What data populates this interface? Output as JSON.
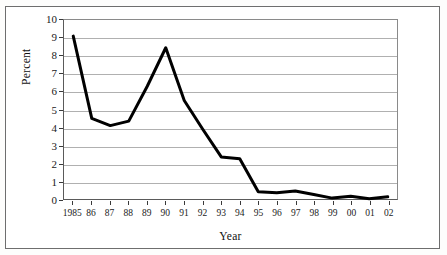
{
  "figure": {
    "background_color": "#ffffff",
    "frame_color": "#6e6e6e",
    "title_remnant": "",
    "line_color": "#000000",
    "grid_color": "#b0b0b0"
  },
  "axes": {
    "ylabel": "Percent",
    "xlabel": "Year",
    "y_ticks": [
      "0",
      "1",
      "2",
      "3",
      "4",
      "5",
      "6",
      "7",
      "8",
      "9",
      "10"
    ],
    "x_ticks": [
      "1985",
      "86",
      "87",
      "88",
      "89",
      "90",
      "91",
      "92",
      "93",
      "94",
      "95",
      "96",
      "97",
      "98",
      "99",
      "00",
      "01",
      "02"
    ]
  },
  "chart_data": {
    "type": "line",
    "title": "",
    "subtitle": "",
    "xlabel": "Year",
    "ylabel": "Percent",
    "categories": [
      "1985",
      "86",
      "87",
      "88",
      "89",
      "90",
      "91",
      "92",
      "93",
      "94",
      "95",
      "96",
      "97",
      "98",
      "99",
      "00",
      "01",
      "02"
    ],
    "values": [
      9.1,
      4.5,
      4.1,
      4.35,
      6.3,
      8.45,
      5.5,
      3.9,
      2.35,
      2.25,
      0.4,
      0.35,
      0.45,
      0.25,
      0.05,
      0.15,
      0.02,
      0.12
    ],
    "ylim": [
      0,
      10
    ],
    "ytick_step": 1,
    "grid": "horizontal",
    "legend": "none",
    "line_width_px": 3,
    "series": [
      {
        "name": "Percent",
        "values": [
          9.1,
          4.5,
          4.1,
          4.35,
          6.3,
          8.45,
          5.5,
          3.9,
          2.35,
          2.25,
          0.4,
          0.35,
          0.45,
          0.25,
          0.05,
          0.15,
          0.02,
          0.12
        ]
      }
    ]
  }
}
